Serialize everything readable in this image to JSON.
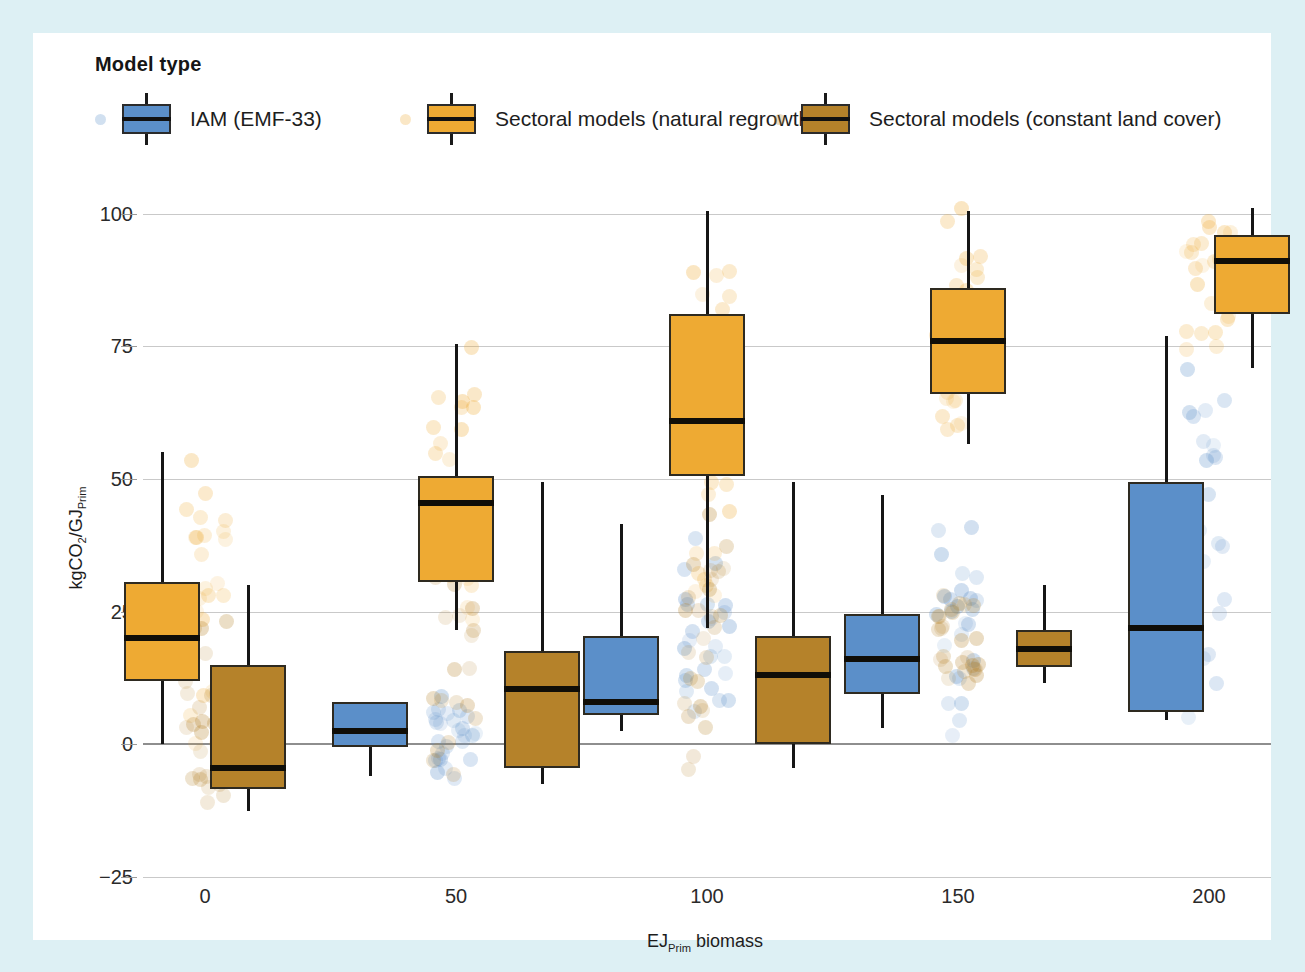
{
  "legend": {
    "title": "Model type",
    "items": [
      {
        "label": "IAM (EMF-33)",
        "color": "#5b8fc9",
        "key": "iam"
      },
      {
        "label": "Sectoral models (natural regrowth)",
        "color": "#eeaa33",
        "key": "natural"
      },
      {
        "label": "Sectoral models (constant land cover)",
        "color": "#b5822a",
        "key": "constant"
      }
    ]
  },
  "axes": {
    "ylabel_main": "kgCO",
    "ylabel_sub1": "2",
    "ylabel_mid": "/GJ",
    "ylabel_sub2": "Prim",
    "xlabel_main": "EJ",
    "xlabel_sub": "Prim",
    "xlabel_rest": " biomass",
    "yticks": [
      "100",
      "75",
      "50",
      "25",
      "0",
      "-25"
    ],
    "ytick_values": [
      100,
      75,
      50,
      25,
      0,
      -25
    ],
    "xticks": [
      "0",
      "50",
      "100",
      "150",
      "200"
    ]
  },
  "chart_data": {
    "type": "box",
    "title": "",
    "xlabel": "EJ_Prim biomass",
    "ylabel": "kgCO2/GJ_Prim",
    "ylim": [
      -25,
      102
    ],
    "grid": true,
    "legend_position": "top",
    "categories": [
      0,
      50,
      100,
      150,
      200
    ],
    "colors": {
      "iam": "#5b8fc9",
      "natural": "#eeaa33",
      "constant": "#b5822a"
    },
    "series": [
      {
        "name": "IAM (EMF-33)",
        "key": "iam",
        "boxes": [
          {
            "category": 0,
            "present": false
          },
          {
            "category": 50,
            "present": true,
            "q1": -0.5,
            "median": 2.5,
            "q3": 8.0,
            "whisker_low": -6.0,
            "whisker_high": 8.0
          },
          {
            "category": 100,
            "present": true,
            "q1": 5.5,
            "median": 8.0,
            "q3": 20.5,
            "whisker_low": 2.5,
            "whisker_high": 41.5
          },
          {
            "category": 150,
            "present": true,
            "q1": 9.5,
            "median": 16.0,
            "q3": 24.5,
            "whisker_low": 3.0,
            "whisker_high": 47.0
          },
          {
            "category": 200,
            "present": true,
            "q1": 6.0,
            "median": 22.0,
            "q3": 49.5,
            "whisker_low": 4.5,
            "whisker_high": 77.0
          }
        ]
      },
      {
        "name": "Sectoral models (natural regrowth)",
        "key": "natural",
        "boxes": [
          {
            "category": 0,
            "present": true,
            "q1": 12.0,
            "median": 20.0,
            "q3": 30.5,
            "whisker_low": 0.0,
            "whisker_high": 55.0
          },
          {
            "category": 50,
            "present": true,
            "q1": 30.5,
            "median": 45.5,
            "q3": 50.5,
            "whisker_low": 21.5,
            "whisker_high": 75.5
          },
          {
            "category": 100,
            "present": true,
            "q1": 50.5,
            "median": 61.0,
            "q3": 81.0,
            "whisker_low": 22.0,
            "whisker_high": 100.5
          },
          {
            "category": 150,
            "present": true,
            "q1": 66.0,
            "median": 76.0,
            "q3": 86.0,
            "whisker_low": 56.5,
            "whisker_high": 100.5
          },
          {
            "category": 200,
            "present": true,
            "q1": 81.0,
            "median": 91.0,
            "q3": 96.0,
            "whisker_low": 71.0,
            "whisker_high": 101.0
          }
        ]
      },
      {
        "name": "Sectoral models (constant land cover)",
        "key": "constant",
        "boxes": [
          {
            "category": 0,
            "present": true,
            "q1": -8.5,
            "median": -4.5,
            "q3": 15.0,
            "whisker_low": -12.5,
            "whisker_high": 30.0
          },
          {
            "category": 50,
            "present": true,
            "q1": -4.5,
            "median": 10.5,
            "q3": 17.5,
            "whisker_low": -7.5,
            "whisker_high": 49.5
          },
          {
            "category": 100,
            "present": true,
            "q1": 0.0,
            "median": 13.0,
            "q3": 20.5,
            "whisker_low": -4.5,
            "whisker_high": 49.5
          },
          {
            "category": 150,
            "present": true,
            "q1": 14.5,
            "median": 18.0,
            "q3": 21.5,
            "whisker_low": 11.5,
            "whisker_high": 30.0
          },
          {
            "category": 200,
            "present": false
          }
        ]
      }
    ],
    "scatter_note": "jittered semi-transparent points overlaid at each category"
  }
}
